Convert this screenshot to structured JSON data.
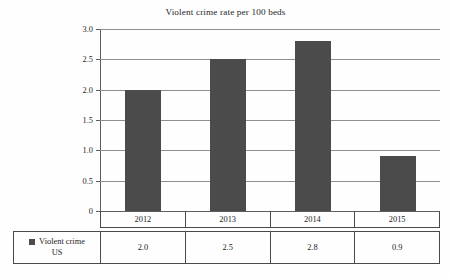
{
  "chart_data": {
    "type": "bar",
    "title": "Violent crime rate per 100 beds",
    "xlabel": "",
    "ylabel": "",
    "categories": [
      "2012",
      "2013",
      "2014",
      "2015"
    ],
    "series": [
      {
        "name": "Violent crime US",
        "name_line1": "Violent crime",
        "name_line2": "US",
        "values": [
          2.0,
          2.5,
          2.8,
          0.9
        ],
        "value_labels": [
          "2.0",
          "2.5",
          "2.8",
          "0.9"
        ],
        "color": "#4b4b4b"
      }
    ],
    "ylim": [
      0,
      3.0
    ],
    "yticks": [
      0,
      0.5,
      1.0,
      1.5,
      2.0,
      2.5,
      3.0
    ],
    "ytick_labels": [
      "0",
      "0.5",
      "1.0",
      "1.5",
      "2.0",
      "2.5",
      "3.0"
    ],
    "grid": true,
    "legend": "below-table",
    "table_below": true
  },
  "colors": {
    "bar": "#4b4b4b",
    "grid": "#8e8e8e",
    "axis": "#5d5d5d",
    "table_border": "#4a4a4a",
    "background": "#fefefe",
    "text": "#242424"
  },
  "icons": {
    "legend_marker": "legend-swatch-icon"
  }
}
